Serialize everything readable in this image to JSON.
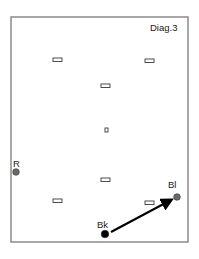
{
  "diagram": {
    "title": "Diag.3",
    "frame": {
      "x": 11,
      "y": 17,
      "width": 177,
      "height": 225,
      "stroke": "#6e6e6e"
    },
    "markers": [
      {
        "id": "m1",
        "x": 53,
        "y": 58,
        "w": 9,
        "h": 3.5
      },
      {
        "id": "m2",
        "x": 145,
        "y": 59,
        "w": 9,
        "h": 3.5
      },
      {
        "id": "m3",
        "x": 101,
        "y": 84,
        "w": 9,
        "h": 3.5
      },
      {
        "id": "m4",
        "x": 105,
        "y": 128,
        "w": 3,
        "h": 4
      },
      {
        "id": "m5",
        "x": 101,
        "y": 178,
        "w": 9,
        "h": 3.5
      },
      {
        "id": "m6",
        "x": 53,
        "y": 199,
        "w": 9,
        "h": 3.5
      },
      {
        "id": "m7",
        "x": 145,
        "y": 201,
        "w": 9,
        "h": 3.5
      }
    ],
    "points": [
      {
        "label": "R",
        "cx": 16,
        "cy": 172,
        "r": 3.3,
        "fill": "#6a6a6a",
        "label_x": 13,
        "label_y": 167
      },
      {
        "label": "Bl",
        "cx": 177,
        "cy": 197,
        "r": 3.3,
        "fill": "#6a6a6a",
        "label_x": 168,
        "label_y": 188
      },
      {
        "label": "Bk",
        "cx": 105,
        "cy": 234,
        "r": 3.8,
        "fill": "#000000",
        "label_x": 97,
        "label_y": 228
      }
    ],
    "arrow": {
      "from": "Bk",
      "to": "Bl",
      "x1": 111,
      "y1": 232,
      "x2": 171,
      "y2": 200,
      "color": "#000000"
    }
  }
}
